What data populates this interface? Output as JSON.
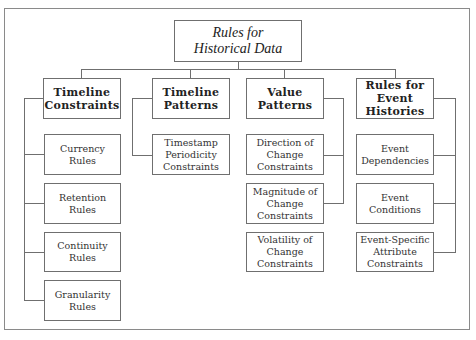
{
  "diagram": {
    "root": {
      "label": "Rules for\nHistorical Data"
    },
    "categories": [
      {
        "label": "Timeline\nConstraints",
        "children": [
          {
            "label": "Currency\nRules"
          },
          {
            "label": "Retention\nRules"
          },
          {
            "label": "Continuity\nRules"
          },
          {
            "label": "Granularity\nRules"
          }
        ]
      },
      {
        "label": "Timeline\nPatterns",
        "children": [
          {
            "label": "Timestamp\nPeriodicity\nConstraints"
          }
        ]
      },
      {
        "label": "Value\nPatterns",
        "children": [
          {
            "label": "Direction of\nChange\nConstraints"
          },
          {
            "label": "Magnitude of\nChange\nConstraints"
          },
          {
            "label": "Volatility of\nChange\nConstraints"
          }
        ]
      },
      {
        "label": "Rules for\nEvent\nHistories",
        "children": [
          {
            "label": "Event\nDependencies"
          },
          {
            "label": "Event\nConditions"
          },
          {
            "label": "Event-Specific\nAttribute\nConstraints"
          }
        ]
      }
    ]
  }
}
